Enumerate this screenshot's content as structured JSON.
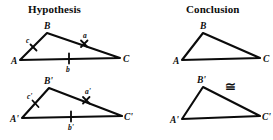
{
  "figure": {
    "type": "geometry-diagram",
    "panels": [
      {
        "id": "hypothesis",
        "title": "Hypothesis",
        "triangles": [
          {
            "id": "abc",
            "vertices": [
              {
                "name": "A",
                "label": "A"
              },
              {
                "name": "B",
                "label": "B"
              },
              {
                "name": "C",
                "label": "C"
              }
            ],
            "sides": [
              {
                "name": "a",
                "label": "a",
                "between": "B-C",
                "tick": "x-cross"
              },
              {
                "name": "b",
                "label": "b",
                "between": "A-C",
                "tick": "single"
              },
              {
                "name": "c",
                "label": "c",
                "between": "A-B",
                "tick": "slash"
              }
            ]
          },
          {
            "id": "abc-prime",
            "vertices": [
              {
                "name": "A-prime",
                "label": "A'"
              },
              {
                "name": "B-prime",
                "label": "B'"
              },
              {
                "name": "C-prime",
                "label": "C'"
              }
            ],
            "sides": [
              {
                "name": "a-prime",
                "label": "a'",
                "between": "B'-C'",
                "tick": "x-cross"
              },
              {
                "name": "b-prime",
                "label": "b'",
                "between": "A'-C'",
                "tick": "single"
              },
              {
                "name": "c-prime",
                "label": "c'",
                "between": "A'-B'",
                "tick": "slash"
              }
            ]
          }
        ]
      },
      {
        "id": "conclusion",
        "title": "Conclusion",
        "congruence_symbol": "≅",
        "triangles": [
          {
            "id": "abc",
            "vertices": [
              {
                "name": "A",
                "label": "A"
              },
              {
                "name": "B",
                "label": "B"
              },
              {
                "name": "C",
                "label": "C"
              }
            ],
            "sides": []
          },
          {
            "id": "abc-prime",
            "vertices": [
              {
                "name": "A-prime",
                "label": "A'"
              },
              {
                "name": "B-prime",
                "label": "B'"
              },
              {
                "name": "C-prime",
                "label": "C'"
              }
            ],
            "sides": []
          }
        ]
      }
    ],
    "colors": {
      "ink": "#0b0b0b",
      "background": "#ffffff"
    }
  }
}
